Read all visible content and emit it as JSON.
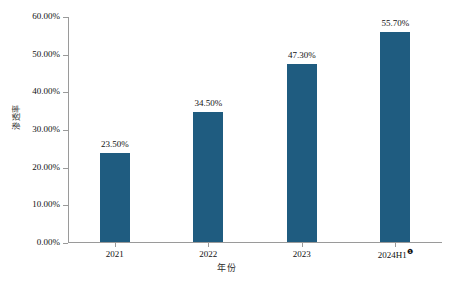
{
  "chart_data": {
    "type": "bar",
    "title": "",
    "xlabel": "年份",
    "ylabel": "渗透率",
    "categories": [
      "2021",
      "2022",
      "2023",
      "2024H1"
    ],
    "category_footnotes": [
      "",
      "",
      "",
      "❶"
    ],
    "values": [
      23.5,
      34.5,
      47.3,
      55.7
    ],
    "value_labels": [
      "23.50%",
      "34.50%",
      "47.30%",
      "55.70%"
    ],
    "ylim": [
      0,
      60
    ],
    "ytick_values": [
      0,
      10,
      20,
      30,
      40,
      50,
      60
    ],
    "ytick_labels": [
      "0.00%",
      "10.00%",
      "20.00%",
      "30.00%",
      "40.00%",
      "50.00%",
      "60.00%"
    ],
    "grid": false,
    "legend": false,
    "legend_position": "none",
    "series": [
      {
        "name": "渗透率",
        "values": [
          23.5,
          34.5,
          47.3,
          55.7
        ],
        "color": "#1f5c80"
      }
    ],
    "colors": {
      "bar": "#1f5c80",
      "axis": "#9a9a9a",
      "text": "#111111",
      "background": "#ffffff"
    }
  }
}
